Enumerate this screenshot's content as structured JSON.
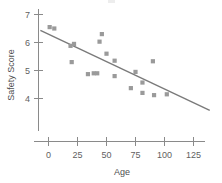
{
  "chart_data": {
    "type": "scatter",
    "title": "",
    "xlabel": "Age",
    "ylabel": "Safety Score",
    "xlim": [
      -8,
      145
    ],
    "ylim": [
      3.3,
      7.25
    ],
    "grid": false,
    "legend": null,
    "x_ticks": [
      0,
      25,
      50,
      75,
      100,
      125
    ],
    "x_tick_labels": [
      "0",
      "25",
      "50",
      "75",
      "100",
      "125"
    ],
    "y_ticks": [
      4,
      5,
      6,
      7
    ],
    "y_tick_labels": [
      "4",
      "5",
      "6",
      "7"
    ],
    "marker_shape": "square",
    "marker_color": "#9a9a9a",
    "points": [
      {
        "x": 1,
        "y": 6.55
      },
      {
        "x": 5,
        "y": 6.5
      },
      {
        "x": 19,
        "y": 5.88
      },
      {
        "x": 22,
        "y": 5.95
      },
      {
        "x": 20,
        "y": 5.3
      },
      {
        "x": 34,
        "y": 4.87
      },
      {
        "x": 39,
        "y": 4.9
      },
      {
        "x": 42,
        "y": 4.9
      },
      {
        "x": 44,
        "y": 6.03
      },
      {
        "x": 46,
        "y": 6.3
      },
      {
        "x": 50,
        "y": 5.6
      },
      {
        "x": 57,
        "y": 5.35
      },
      {
        "x": 57,
        "y": 4.8
      },
      {
        "x": 71,
        "y": 4.37
      },
      {
        "x": 75,
        "y": 4.95
      },
      {
        "x": 81,
        "y": 4.57
      },
      {
        "x": 81,
        "y": 4.2
      },
      {
        "x": 90,
        "y": 5.33
      },
      {
        "x": 91,
        "y": 4.12
      },
      {
        "x": 102,
        "y": 4.15
      }
    ],
    "trend_line": {
      "type": "linear-fit",
      "x_start": -7,
      "y_start": 6.43,
      "x_end": 139,
      "y_end": 3.58
    },
    "annotations": []
  }
}
